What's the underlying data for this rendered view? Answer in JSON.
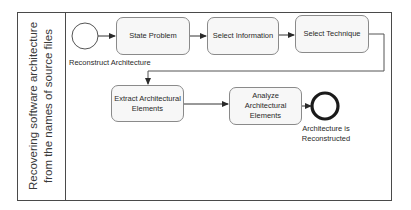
{
  "lane": {
    "title": "Recovering software architecture from the names of source files"
  },
  "start_event": {
    "label": "Reconstruct Architecture"
  },
  "tasks": [
    {
      "id": "state-problem",
      "label": "State Problem"
    },
    {
      "id": "select-information",
      "label": "Select Information"
    },
    {
      "id": "select-technique",
      "label": "Select Technique"
    },
    {
      "id": "extract-elements",
      "label": "Extract Architectural Elements"
    },
    {
      "id": "analyze-elements",
      "label": "Analyze Architectural Elements"
    }
  ],
  "end_event": {
    "label": "Architecture is Reconstructed"
  },
  "colors": {
    "border": "#4a4a4a",
    "task_fill": "#f7f7f7",
    "task_border": "#8a8a8a",
    "end_event": "#1a1a1a"
  }
}
